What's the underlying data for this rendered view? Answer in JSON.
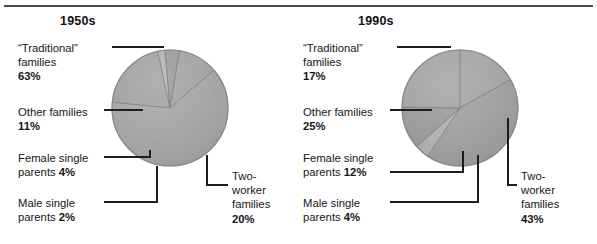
{
  "figure": {
    "has_top_rule": true,
    "background": "#ffffff",
    "ink": "#1a1a1a"
  },
  "panels": [
    {
      "id": "panel-1950s",
      "title": "1950s",
      "center": [
        170,
        108
      ],
      "radius": 58,
      "start_angle": -41,
      "labels": [
        {
          "key": "traditional",
          "name": "traditional-families",
          "lines": [
            "“Traditional”",
            "families"
          ],
          "percent": "63%",
          "percent_on_own_line": true,
          "x": 18,
          "y": 41
        },
        {
          "key": "other",
          "name": "other-families",
          "lines": [
            "Other families"
          ],
          "percent": "11%",
          "percent_on_own_line": true,
          "x": 18,
          "y": 105
        },
        {
          "key": "female_single",
          "name": "female-single-parents",
          "lines": [
            "Female single"
          ],
          "percent": "parents 4%",
          "percent_on_own_line": true,
          "x": 18,
          "y": 151
        },
        {
          "key": "male_single",
          "name": "male-single-parents",
          "lines": [
            "Male single"
          ],
          "percent": "parents 2%",
          "percent_on_own_line": true,
          "x": 18,
          "y": 196
        },
        {
          "key": "two_worker",
          "name": "two-worker-families",
          "lines": [
            "Two-",
            "worker",
            "families"
          ],
          "percent": "20%",
          "percent_on_own_line": true,
          "x": 232,
          "y": 169
        }
      ]
    },
    {
      "id": "panel-1990s",
      "title": "1990s",
      "center": [
        460,
        108
      ],
      "radius": 58,
      "start_angle": -90,
      "labels": [
        {
          "key": "traditional",
          "name": "traditional-families",
          "lines": [
            "“Traditional”",
            "families"
          ],
          "percent": "17%",
          "percent_on_own_line": true,
          "x": 303,
          "y": 41
        },
        {
          "key": "other",
          "name": "other-families",
          "lines": [
            "Other families"
          ],
          "percent": "25%",
          "percent_on_own_line": true,
          "x": 303,
          "y": 105
        },
        {
          "key": "female_single",
          "name": "female-single-parents",
          "lines": [
            "Female single"
          ],
          "percent": "parents 12%",
          "percent_on_own_line": true,
          "x": 303,
          "y": 151
        },
        {
          "key": "male_single",
          "name": "male-single-parents",
          "lines": [
            "Male single"
          ],
          "percent": "parents 4%",
          "percent_on_own_line": true,
          "x": 303,
          "y": 196
        },
        {
          "key": "two_worker",
          "name": "two-worker-families",
          "lines": [
            "Two-",
            "worker",
            "families"
          ],
          "percent": "43%",
          "percent_on_own_line": true,
          "x": 521,
          "y": 169
        }
      ]
    }
  ],
  "chart_data": [
    {
      "type": "pie",
      "title": "1950s",
      "labels": [
        "“Traditional” families",
        "Two-worker families",
        "Male single parents",
        "Female single parents",
        "Other families"
      ],
      "values": [
        63,
        20,
        2,
        4,
        11
      ],
      "value_suffix": "%",
      "slice_colors": [
        "#a3a3a3",
        "#9a9a9a",
        "#bcbcbc",
        "#8f8f8f",
        "#9e9e9e"
      ],
      "start_angle": -41,
      "direction": "clockwise",
      "legend": "callout-labels",
      "grid": false
    },
    {
      "type": "pie",
      "title": "1990s",
      "labels": [
        "“Traditional” families",
        "Two-worker families",
        "Male single parents",
        "Female single parents",
        "Other families"
      ],
      "values": [
        17,
        43,
        4,
        12,
        25
      ],
      "value_suffix": "%",
      "slice_colors": [
        "#a3a3a3",
        "#9a9a9a",
        "#bcbcbc",
        "#8f8f8f",
        "#9e9e9e"
      ],
      "start_angle": -90,
      "direction": "clockwise",
      "legend": "callout-labels",
      "grid": false
    }
  ]
}
